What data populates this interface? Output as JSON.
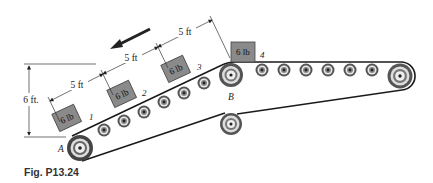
{
  "figure": {
    "caption": "Fig. P13.24",
    "direction_arrow": "arrow-left-down",
    "dimensions": {
      "segment_1": "5 ft",
      "segment_2": "5 ft",
      "segment_3": "5 ft",
      "height": "6 ft."
    },
    "points": {
      "A": "A",
      "B": "B"
    },
    "packages": [
      {
        "label": "6 lb",
        "number": "1"
      },
      {
        "label": "6 lb",
        "number": "2"
      },
      {
        "label": "6 lb",
        "number": "3"
      },
      {
        "label": "6 lb",
        "number": "4"
      }
    ],
    "colors": {
      "package_fill": "#8a8a8a",
      "belt": "#1a1a1a",
      "roller": "#555555"
    }
  }
}
